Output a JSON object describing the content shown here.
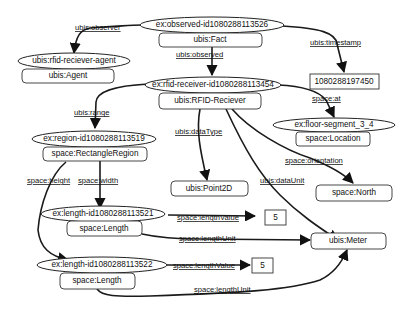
{
  "nodes": {
    "fact": {
      "id": "ex:observed-id1080288113526",
      "type": "ubis:Fact"
    },
    "agent": {
      "id": "ubis:rfid-reciever-agent",
      "type": "ubis:Agent"
    },
    "timestamp_value": "1080288197450",
    "receiver": {
      "id": "ex:rfid-receiver-id1080288113454",
      "type": "ubis:RFID-Reciever"
    },
    "location": {
      "id": "ex:floor-segment_3_4",
      "type": "space:Location"
    },
    "region": {
      "id": "ex:region-id1080288113519",
      "type": "space:RectangleRegion"
    },
    "point2d": "ubis:Point2D",
    "north": "space:North",
    "length1": {
      "id": "ex:length-id1080288113521",
      "type": "space:Length"
    },
    "length2": {
      "id": "ex:length-id1080288113522",
      "type": "space:Length"
    },
    "meter": "ubis:Meter",
    "value1": "5",
    "value2": "5"
  },
  "edges": {
    "observer": "ubis:observer",
    "timestamp": "ubis:timestamp",
    "observed": "ubis:observed",
    "at": "space:at",
    "range": "ubis:range",
    "dataType": "ubis:dataType",
    "orientation": "space:orientation",
    "dataUnit": "ubis:dataUnit",
    "height": "space:height",
    "width": "space:width",
    "lengthValue1": "space:lengthValue",
    "lengthUnit1": "space:lengthUnit",
    "lengthValue2": "space:lengthValue",
    "lengthUnit2": "space:lengthUnit"
  },
  "colors": {
    "stroke": "#1a1a1a",
    "background": "#ffffff"
  }
}
